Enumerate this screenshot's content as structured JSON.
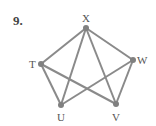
{
  "problem": {
    "number": "9."
  },
  "graph": {
    "vertices": [
      {
        "id": "X",
        "label": "X",
        "x": 86,
        "y": 28,
        "lx": 82,
        "ly": 22
      },
      {
        "id": "T",
        "label": "T",
        "x": 41,
        "y": 64,
        "lx": 29,
        "ly": 68
      },
      {
        "id": "W",
        "label": "W",
        "x": 133,
        "y": 60,
        "lx": 137,
        "ly": 64
      },
      {
        "id": "U",
        "label": "U",
        "x": 61,
        "y": 105,
        "lx": 57,
        "ly": 121
      },
      {
        "id": "V",
        "label": "V",
        "x": 116,
        "y": 104,
        "lx": 112,
        "ly": 121
      }
    ],
    "edges": [
      [
        "X",
        "T"
      ],
      [
        "X",
        "W"
      ],
      [
        "X",
        "U"
      ],
      [
        "X",
        "V"
      ],
      [
        "T",
        "U"
      ],
      [
        "T",
        "V"
      ],
      [
        "W",
        "U"
      ],
      [
        "W",
        "V"
      ]
    ],
    "edge_color": "#8a8a8a",
    "vertex_color": "#808080"
  }
}
